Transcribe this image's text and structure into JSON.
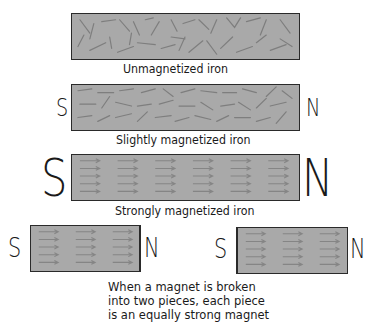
{
  "figure": {
    "panels": [
      {
        "id": "unmagnetized",
        "label": "Unmagnetized iron",
        "south_pole": "",
        "north_pole": "",
        "domain_alignment": "random"
      },
      {
        "id": "slightly",
        "label": "Slightly magnetized iron",
        "south_pole": "S",
        "north_pole": "N",
        "domain_alignment": "partially aligned"
      },
      {
        "id": "strongly",
        "label": "Strongly magnetized iron",
        "south_pole": "S",
        "north_pole": "N",
        "domain_alignment": "fully aligned"
      }
    ],
    "broken": {
      "left_piece": {
        "south_pole": "S",
        "north_pole": "N"
      },
      "right_piece": {
        "south_pole": "S",
        "north_pole": "N"
      },
      "caption_lines": [
        "When a magnet is broken",
        "into two pieces, each piece",
        "is an equally strong magnet"
      ]
    },
    "colors": {
      "bar_fill": "#a9a9a9",
      "outline": "#2a2a2a",
      "domain_arrow": "#8a8a8a"
    }
  }
}
